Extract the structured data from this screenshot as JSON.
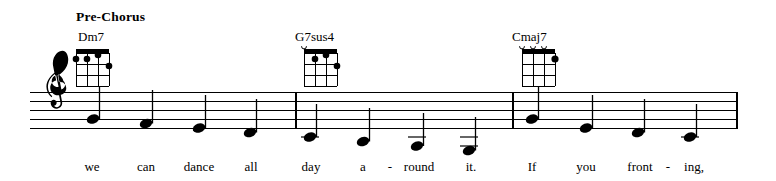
{
  "page": {
    "background": "#ffffff",
    "ink": "#000000",
    "width": 776,
    "height": 181
  },
  "section": {
    "label": "Pre-Chorus",
    "x": 76,
    "y": 10
  },
  "staff": {
    "x_start": 30,
    "x_end": 738,
    "top_line_y": 92,
    "line_spacing": 9,
    "line_count": 5,
    "clef": "treble-clef"
  },
  "barlines": [
    {
      "name": "barline-measure-1-end",
      "x": 296
    },
    {
      "name": "barline-measure-2-end",
      "x": 513
    },
    {
      "name": "barline-final",
      "x": 737
    }
  ],
  "chords": [
    {
      "name": "Dm7",
      "label_x": 78,
      "label_y": 30,
      "diagram_x": 72,
      "diagram_y": 46,
      "strings": 4,
      "frets": 4,
      "open_strings": [],
      "muted_strings": [],
      "dots": [
        {
          "string": 1,
          "fret": 2
        },
        {
          "string": 2,
          "fret": 2
        },
        {
          "string": 3,
          "fret": 1
        },
        {
          "string": 4,
          "fret": 3
        }
      ]
    },
    {
      "name": "G7sus4",
      "label_x": 295,
      "label_y": 30,
      "diagram_x": 300,
      "diagram_y": 46,
      "strings": 4,
      "frets": 4,
      "open_strings": [
        1
      ],
      "muted_strings": [],
      "dots": [
        {
          "string": 2,
          "fret": 2
        },
        {
          "string": 3,
          "fret": 1
        },
        {
          "string": 4,
          "fret": 3
        }
      ]
    },
    {
      "name": "Cmaj7",
      "label_x": 512,
      "label_y": 30,
      "diagram_x": 518,
      "diagram_y": 46,
      "strings": 4,
      "frets": 4,
      "open_strings": [
        1,
        2,
        3
      ],
      "muted_strings": [],
      "dots": [
        {
          "string": 4,
          "fret": 2
        }
      ]
    }
  ],
  "notes": [
    {
      "id": "note-1",
      "x": 92,
      "pitch": "G4",
      "staff_pos": 2,
      "duration": "quarter",
      "stem": "up",
      "ledger_lines": 0
    },
    {
      "id": "note-2",
      "x": 146,
      "pitch": "F4",
      "staff_pos": 1,
      "duration": "quarter",
      "stem": "up",
      "ledger_lines": 0
    },
    {
      "id": "note-3",
      "x": 199,
      "pitch": "E4",
      "staff_pos": 0,
      "duration": "quarter",
      "stem": "up",
      "ledger_lines": 0
    },
    {
      "id": "note-4",
      "x": 250,
      "pitch": "D4",
      "staff_pos": -1,
      "duration": "quarter",
      "stem": "up",
      "ledger_lines": 0
    },
    {
      "id": "note-5",
      "x": 310,
      "pitch": "C4",
      "staff_pos": -2,
      "duration": "quarter",
      "stem": "up",
      "ledger_lines": 1
    },
    {
      "id": "note-6",
      "x": 363,
      "pitch": "B3",
      "staff_pos": -3,
      "duration": "quarter",
      "stem": "up",
      "ledger_lines": 1
    },
    {
      "id": "note-7",
      "x": 417,
      "pitch": "A3",
      "staff_pos": -4,
      "duration": "quarter",
      "stem": "up",
      "ledger_lines": 1
    },
    {
      "id": "note-8",
      "x": 469,
      "pitch": "G3",
      "staff_pos": -5,
      "duration": "quarter",
      "stem": "up",
      "ledger_lines": 2
    },
    {
      "id": "note-9",
      "x": 531,
      "pitch": "G4",
      "staff_pos": 2,
      "duration": "quarter",
      "stem": "up",
      "ledger_lines": 0
    },
    {
      "id": "note-10",
      "x": 586,
      "pitch": "E4",
      "staff_pos": 0,
      "duration": "quarter",
      "stem": "up",
      "ledger_lines": 0
    },
    {
      "id": "note-11",
      "x": 638,
      "pitch": "D4",
      "staff_pos": -1,
      "duration": "quarter",
      "stem": "up",
      "ledger_lines": 0
    },
    {
      "id": "note-12",
      "x": 690,
      "pitch": "C4",
      "staff_pos": -2,
      "duration": "quarter",
      "stem": "up",
      "ledger_lines": 1
    }
  ],
  "lyrics": [
    {
      "text": "we",
      "x": 92,
      "y": 160
    },
    {
      "text": "can",
      "x": 146,
      "y": 160
    },
    {
      "text": "dance",
      "x": 199,
      "y": 160
    },
    {
      "text": "all",
      "x": 251,
      "y": 160
    },
    {
      "text": "day",
      "x": 311,
      "y": 160
    },
    {
      "text": "a",
      "x": 363,
      "y": 160
    },
    {
      "text": "-",
      "x": 390,
      "y": 160
    },
    {
      "text": "round",
      "x": 419,
      "y": 160
    },
    {
      "text": "it.",
      "x": 471,
      "y": 160
    },
    {
      "text": "If",
      "x": 532,
      "y": 160
    },
    {
      "text": "you",
      "x": 586,
      "y": 160
    },
    {
      "text": "front",
      "x": 640,
      "y": 160
    },
    {
      "text": "-",
      "x": 668,
      "y": 160
    },
    {
      "text": "ing,",
      "x": 694,
      "y": 160
    }
  ]
}
